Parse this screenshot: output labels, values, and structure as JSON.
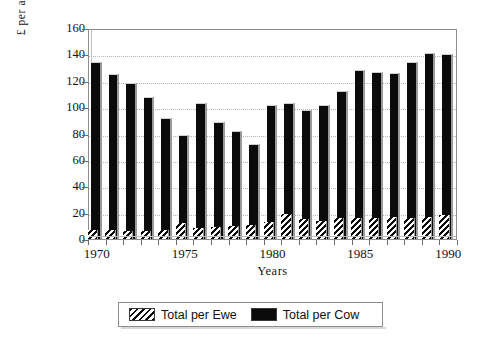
{
  "chart_data": {
    "type": "bar",
    "title": "",
    "xlabel": "Years",
    "ylabel": "£ per animal",
    "categories": [
      1970,
      1971,
      1972,
      1973,
      1974,
      1975,
      1976,
      1977,
      1978,
      1979,
      1980,
      1981,
      1982,
      1983,
      1984,
      1985,
      1986,
      1987,
      1988,
      1989,
      1990
    ],
    "xtick_labels": [
      "1970",
      "1975",
      "1980",
      "1985",
      "1990"
    ],
    "xtick_values": [
      1970,
      1975,
      1980,
      1985,
      1990
    ],
    "ytick_labels": [
      "0",
      "20",
      "40",
      "60",
      "80",
      "100",
      "120",
      "140",
      "160"
    ],
    "ytick_values": [
      0,
      20,
      40,
      60,
      80,
      100,
      120,
      140,
      160
    ],
    "ylim": [
      0,
      160
    ],
    "grid": true,
    "grid_axis": "y",
    "legend_position": "below-axes",
    "series": [
      {
        "name": "Total per Ewe",
        "pattern": "diagonal-hatch",
        "color": "#0b0b0b",
        "values": [
          7,
          7,
          6,
          6,
          7,
          12,
          8,
          9,
          10,
          11,
          13,
          19,
          15,
          14,
          16,
          16,
          16,
          17,
          16,
          17,
          18
        ]
      },
      {
        "name": "Total per Cow",
        "pattern": "solid",
        "color": "#0b0b0b",
        "values": [
          134,
          125,
          118,
          108,
          92,
          79,
          103,
          89,
          82,
          72,
          102,
          103,
          98,
          102,
          112,
          128,
          127,
          126,
          134,
          141,
          140
        ]
      }
    ]
  },
  "legend": {
    "entries": [
      {
        "label": "Total per Ewe"
      },
      {
        "label": "Total per Cow"
      }
    ]
  },
  "axes": {
    "ylabel": "£ per animal",
    "xlabel": "Years"
  }
}
